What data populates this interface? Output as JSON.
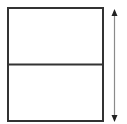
{
  "diagram": {
    "panels": [
      {
        "id": "top-panel",
        "label": ""
      },
      {
        "id": "bottom-panel",
        "label": ""
      }
    ],
    "dimension_arrow": {
      "orientation": "vertical",
      "heads": "both",
      "label": ""
    },
    "colors": {
      "outline": "#333333",
      "arrow_shaft": "#8a8a8a",
      "arrow_head": "#222222",
      "background": "#ffffff"
    }
  }
}
